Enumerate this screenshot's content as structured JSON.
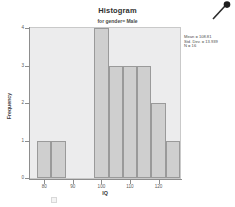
{
  "chart_data": {
    "type": "bar",
    "title": "Histogram",
    "subtitle": "for gender= Male",
    "xlabel": "IQ",
    "ylabel": "Frequency",
    "xlim": [
      75,
      127.5
    ],
    "ylim": [
      0,
      4
    ],
    "grid": false,
    "legend": "none",
    "bin_width": 5,
    "bins": [
      {
        "left": 77.5,
        "right": 82.5,
        "value": 1
      },
      {
        "left": 82.5,
        "right": 87.5,
        "value": 1
      },
      {
        "left": 87.5,
        "right": 92.5,
        "value": 0
      },
      {
        "left": 92.5,
        "right": 97.5,
        "value": 0
      },
      {
        "left": 97.5,
        "right": 102.5,
        "value": 4
      },
      {
        "left": 102.5,
        "right": 107.5,
        "value": 3
      },
      {
        "left": 107.5,
        "right": 112.5,
        "value": 3
      },
      {
        "left": 112.5,
        "right": 117.5,
        "value": 3
      },
      {
        "left": 117.5,
        "right": 122.5,
        "value": 2
      },
      {
        "left": 122.5,
        "right": 127.5,
        "value": 1
      }
    ],
    "categories": [
      "77.5-82.5",
      "82.5-87.5",
      "87.5-92.5",
      "92.5-97.5",
      "97.5-102.5",
      "102.5-107.5",
      "107.5-112.5",
      "112.5-117.5",
      "117.5-122.5",
      "122.5-127.5"
    ],
    "values": [
      1,
      1,
      0,
      0,
      4,
      3,
      3,
      3,
      2,
      1
    ],
    "x_ticks": [
      "80",
      "90",
      "100",
      "110",
      "120"
    ],
    "x_tick_values": [
      80,
      90,
      100,
      110,
      120
    ],
    "y_ticks": [
      "0",
      "1",
      "2",
      "3",
      "4"
    ],
    "y_tick_values": [
      0,
      1,
      2,
      3,
      4
    ],
    "annotations": {
      "mean": "Mean = 108.81",
      "std_dev": "Std. Dev. = 13.939",
      "n": "N = 16"
    },
    "colors": {
      "bar_fill": "#cfcfcf",
      "bar_border": "#9a9a9a",
      "plot_background": "#ececed",
      "axis": "#8d8d8d",
      "text": "#4e4e4e"
    }
  },
  "icons": {
    "cursor": "magnifier-cursor-icon"
  }
}
